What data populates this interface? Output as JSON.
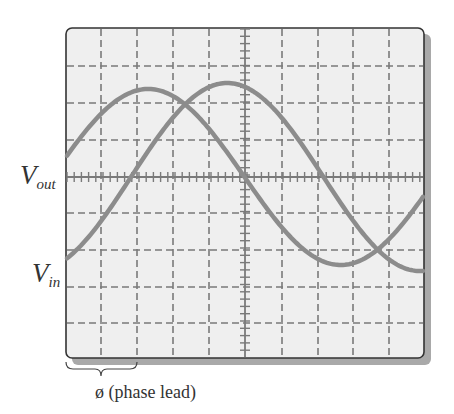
{
  "diagram": {
    "labels": {
      "vout_main": "V",
      "vout_sub": "out",
      "vin_main": "V",
      "vin_sub": "in",
      "phase": "ø (phase lead)"
    },
    "screen": {
      "background": "#efefef",
      "border_color": "#333333",
      "shadow_color": "#a9a9a9",
      "grid_color": "#7a7a7a",
      "divisions_x": 10,
      "divisions_y": 9
    },
    "traces": [
      {
        "name": "V_out",
        "color": "#8c8c8c",
        "description": "leading sine wave"
      },
      {
        "name": "V_in",
        "color": "#8c8c8c",
        "description": "lagging sine wave"
      }
    ],
    "phase_bracket": {
      "from_x_division": 0,
      "to_x_division": 2
    }
  }
}
